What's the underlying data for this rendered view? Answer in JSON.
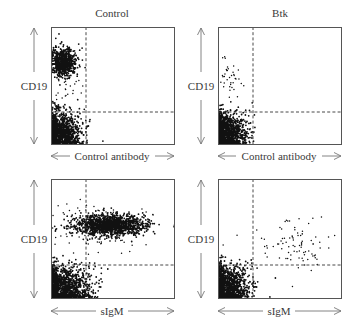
{
  "figure": {
    "columns": [
      "Control",
      "Btk"
    ],
    "y_axis_label": "CD19",
    "x_axis_labels": [
      "Control antibody",
      "sIgM"
    ]
  },
  "chart_data": [
    {
      "type": "scatter",
      "panel": "top-left",
      "title": "Control",
      "xlabel": "Control antibody",
      "ylabel": "CD19",
      "box": [
        51,
        27,
        174,
        144
      ],
      "gate_x": 86,
      "gate_y": 112,
      "clusters": [
        {
          "name": "CD19+ population",
          "cx": 63,
          "cy": 62,
          "sx": 7,
          "sy": 7,
          "n": 700,
          "dense": true
        },
        {
          "name": "CD19+ tail",
          "cx": 66,
          "cy": 85,
          "sx": 7,
          "sy": 10,
          "n": 40,
          "dense": false
        },
        {
          "name": "CD19- population",
          "cx": 57,
          "cy": 133,
          "sx": 12,
          "sy": 10,
          "n": 1400,
          "dense": true,
          "clipLeft": true
        }
      ]
    },
    {
      "type": "scatter",
      "panel": "top-right",
      "title": "Btk",
      "xlabel": "Control antibody",
      "ylabel": "CD19",
      "box": [
        218,
        27,
        341,
        144
      ],
      "gate_x": 253,
      "gate_y": 112,
      "clusters": [
        {
          "name": "sparse CD19+ events",
          "cx": 230,
          "cy": 80,
          "sx": 6,
          "sy": 9,
          "n": 40,
          "dense": false
        },
        {
          "name": "CD19- population",
          "cx": 224,
          "cy": 133,
          "sx": 11,
          "sy": 10,
          "n": 1400,
          "dense": true,
          "clipLeft": true
        }
      ]
    },
    {
      "type": "scatter",
      "panel": "bottom-left",
      "title": "",
      "xlabel": "sIgM",
      "ylabel": "CD19",
      "box": [
        51,
        179,
        174,
        298
      ],
      "gate_x": 86,
      "gate_y": 265,
      "clusters": [
        {
          "name": "CD19+ sIgM+ band",
          "cx": 110,
          "cy": 225,
          "sx": 18,
          "sy": 5,
          "n": 1300,
          "dense": true
        },
        {
          "name": "band scatter",
          "cx": 100,
          "cy": 226,
          "sx": 24,
          "sy": 11,
          "n": 160,
          "dense": false
        },
        {
          "name": "CD19- population",
          "cx": 60,
          "cy": 288,
          "sx": 15,
          "sy": 11,
          "n": 1600,
          "dense": true,
          "clipLeft": true
        }
      ]
    },
    {
      "type": "scatter",
      "panel": "bottom-right",
      "title": "",
      "xlabel": "sIgM",
      "ylabel": "CD19",
      "box": [
        218,
        179,
        341,
        298
      ],
      "gate_x": 253,
      "gate_y": 265,
      "clusters": [
        {
          "name": "sparse CD19+ sIgM+ events",
          "cx": 299,
          "cy": 245,
          "sx": 12,
          "sy": 14,
          "n": 70,
          "dense": false
        },
        {
          "name": "scattered events",
          "cx": 275,
          "cy": 245,
          "sx": 22,
          "sy": 18,
          "n": 18,
          "dense": false
        },
        {
          "name": "CD19- population",
          "cx": 224,
          "cy": 288,
          "sx": 12,
          "sy": 11,
          "n": 1500,
          "dense": true,
          "clipLeft": true
        }
      ]
    }
  ]
}
